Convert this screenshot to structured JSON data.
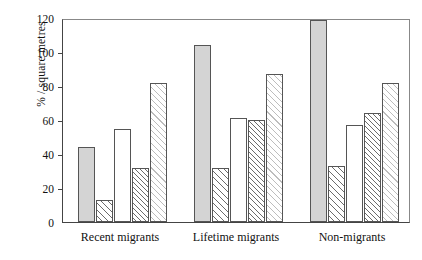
{
  "chart_data": {
    "type": "bar",
    "title": "",
    "xlabel": "",
    "ylabel": "% / square metres",
    "ylim": [
      0,
      120
    ],
    "yticks": [
      0,
      20,
      40,
      60,
      80,
      100,
      120
    ],
    "ytick_labels": [
      "0",
      "20",
      "40",
      "60",
      "80",
      "100",
      "120"
    ],
    "grid": false,
    "legend": "none",
    "categories": [
      "Recent migrants",
      "Lifetime migrants",
      "Non-migrants"
    ],
    "series": [
      {
        "name": "series-1",
        "fill": "solid-grey",
        "values": [
          44,
          104,
          119
        ]
      },
      {
        "name": "series-2",
        "fill": "hatch-right",
        "values": [
          13,
          32,
          33
        ]
      },
      {
        "name": "series-3",
        "fill": "white",
        "values": [
          55,
          61,
          57
        ]
      },
      {
        "name": "series-4",
        "fill": "hatch-dense",
        "values": [
          32,
          60,
          64
        ]
      },
      {
        "name": "series-5",
        "fill": "dotted-hatch",
        "values": [
          82,
          87,
          82
        ]
      }
    ]
  },
  "colors": {
    "solid_grey": "#d4d4d4",
    "axis": "#444444",
    "bar_outline": "#555555",
    "background": "#ffffff"
  }
}
